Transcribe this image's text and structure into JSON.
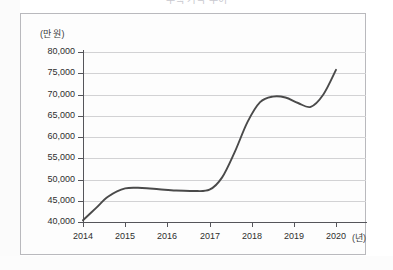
{
  "figure": {
    "title": "주택 가격 추이",
    "y_unit_label": "(만 원)",
    "x_unit_label": "(년)"
  },
  "chart_data": {
    "type": "line",
    "title": "주택 가격 추이",
    "xlabel": "(년)",
    "ylabel": "(만 원)",
    "xlim": [
      2014,
      2020
    ],
    "ylim": [
      40000,
      80000
    ],
    "ytick_step": 5000,
    "grid": true,
    "legend": "none",
    "x_tick_labels": [
      "2014",
      "2015",
      "2016",
      "2017",
      "2018",
      "2019",
      "2020"
    ],
    "y_tick_labels": [
      "40,000",
      "45,000",
      "50,000",
      "55,000",
      "60,000",
      "65,000",
      "70,000",
      "75,000",
      "80,000"
    ],
    "y_tick_values": [
      40000,
      45000,
      50000,
      55000,
      60000,
      65000,
      70000,
      75000,
      80000
    ],
    "series": [
      {
        "name": "가격",
        "color": "#4a4a4a",
        "x": [
          2014.0,
          2014.3,
          2014.6,
          2015.0,
          2015.4,
          2015.8,
          2016.2,
          2016.6,
          2017.0,
          2017.3,
          2017.6,
          2017.9,
          2018.2,
          2018.5,
          2018.8,
          2019.1,
          2019.4,
          2019.7,
          2020.0
        ],
        "values": [
          40400,
          43200,
          46000,
          47900,
          48000,
          47700,
          47400,
          47300,
          47600,
          50500,
          56500,
          63500,
          68200,
          69500,
          69300,
          68000,
          67100,
          70000,
          75800
        ]
      }
    ],
    "annotations": []
  }
}
